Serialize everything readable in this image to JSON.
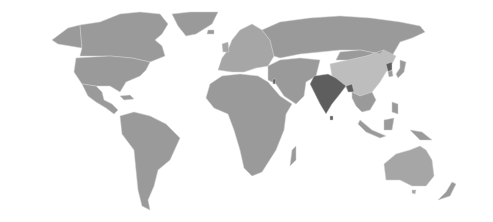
{
  "map": {
    "title": "",
    "type": "choropleth-world",
    "colors": {
      "background": "#ffffff",
      "default": "#9a9a9a",
      "light": "#bdbdbd",
      "dark": "#5e5e5e",
      "border": "#cfcfcf"
    },
    "highlighted_regions": [
      {
        "name": "India",
        "shade": "dark"
      },
      {
        "name": "Bangladesh",
        "shade": "dark"
      },
      {
        "name": "North Korea",
        "shade": "dark"
      },
      {
        "name": "Israel",
        "shade": "dark"
      },
      {
        "name": "China",
        "shade": "light"
      }
    ]
  }
}
